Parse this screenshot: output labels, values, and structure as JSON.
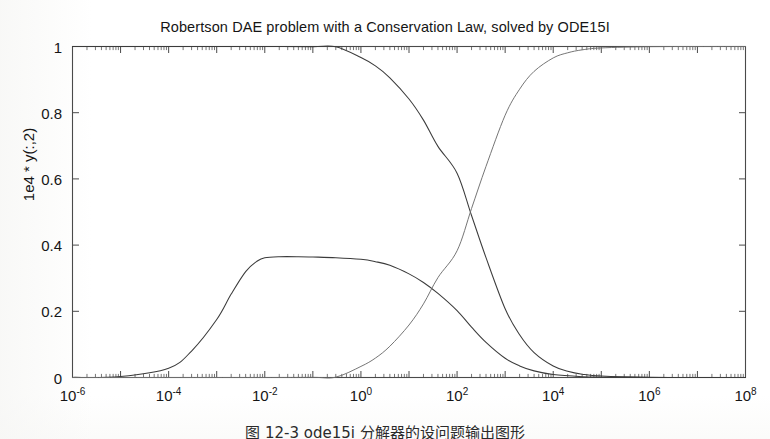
{
  "figure": {
    "title": "Robertson DAE problem with a Conservation Law, solved by ODE15I",
    "ylabel": "1e4 * y(:,2)",
    "caption": "图 12-3  ode15i 分解器的设问题输出图形"
  },
  "axes": {
    "x_tick_labels": [
      {
        "mantissa": "10",
        "exponent": "-6",
        "value": 1e-06
      },
      {
        "mantissa": "10",
        "exponent": "-4",
        "value": 0.0001
      },
      {
        "mantissa": "10",
        "exponent": "-2",
        "value": 0.01
      },
      {
        "mantissa": "10",
        "exponent": "0",
        "value": 1
      },
      {
        "mantissa": "10",
        "exponent": "2",
        "value": 100
      },
      {
        "mantissa": "10",
        "exponent": "4",
        "value": 10000
      },
      {
        "mantissa": "10",
        "exponent": "6",
        "value": 1000000
      },
      {
        "mantissa": "10",
        "exponent": "8",
        "value": 100000000
      }
    ],
    "y_tick_labels": [
      "0",
      "0.2",
      "0.4",
      "0.6",
      "0.8",
      "1"
    ]
  },
  "colors": {
    "curve": "#3b3b3b",
    "curve_light": "#6e6e6e",
    "axis": "#4a4a4a",
    "background": "#ffffff",
    "text": "#151515"
  },
  "chart_data": {
    "type": "line",
    "title": "Robertson DAE problem with a Conservation Law, solved by ODE15I",
    "xlabel": "",
    "ylabel": "1e4 * y(:,2)",
    "xscale": "log",
    "yscale": "linear",
    "xlim": [
      1e-06,
      100000000.0
    ],
    "ylim": [
      0,
      1
    ],
    "grid": false,
    "legend": "none",
    "minor_ticks": "log-decade, inward",
    "series": [
      {
        "name": "y(:,1)",
        "description": "species A, decays from 1 to 0",
        "points": [
          [
            1e-06,
            1.0
          ],
          [
            1e-05,
            1.0
          ],
          [
            0.0001,
            1.0
          ],
          [
            0.001,
            1.0
          ],
          [
            0.01,
            0.9999
          ],
          [
            0.1,
            0.9996
          ],
          [
            0.3,
            0.999
          ],
          [
            1.0,
            0.9665
          ],
          [
            2.0,
            0.9414
          ],
          [
            4.0,
            0.9055
          ],
          [
            10.0,
            0.8414
          ],
          [
            20.0,
            0.7776
          ],
          [
            40.0,
            0.6982
          ],
          [
            100.0,
            0.6172
          ],
          [
            200.0,
            0.4895
          ],
          [
            400.0,
            0.3621
          ],
          [
            1000.0,
            0.2076
          ],
          [
            2000.0,
            0.129
          ],
          [
            4000.0,
            0.0751
          ],
          [
            10000.0,
            0.0345
          ],
          [
            20000.0,
            0.019
          ],
          [
            40000.0,
            0.0101
          ],
          [
            100000.0,
            0.0043
          ],
          [
            1000000.0,
            0.00045
          ],
          [
            10000000.0,
            4.5e-05
          ],
          [
            100000000.0,
            4.5e-06
          ]
        ]
      },
      {
        "name": "1e4 * y(:,2)",
        "description": "species B scaled by 1e4, bump peaking near 0.365 plateau between 1e-2 and 1e0",
        "points": [
          [
            1e-06,
            0.0003
          ],
          [
            1e-05,
            0.003
          ],
          [
            0.0001,
            0.028
          ],
          [
            0.0003,
            0.08
          ],
          [
            0.001,
            0.175
          ],
          [
            0.002,
            0.252
          ],
          [
            0.004,
            0.32
          ],
          [
            0.007,
            0.352
          ],
          [
            0.01,
            0.362
          ],
          [
            0.02,
            0.365
          ],
          [
            0.05,
            0.365
          ],
          [
            0.1,
            0.364
          ],
          [
            0.3,
            0.362
          ],
          [
            1.0,
            0.357
          ],
          [
            2.0,
            0.35
          ],
          [
            4.0,
            0.339
          ],
          [
            10.0,
            0.313
          ],
          [
            20.0,
            0.287
          ],
          [
            40.0,
            0.254
          ],
          [
            100.0,
            0.202
          ],
          [
            200.0,
            0.152
          ],
          [
            400.0,
            0.106
          ],
          [
            1000.0,
            0.058
          ],
          [
            2000.0,
            0.035
          ],
          [
            4000.0,
            0.02
          ],
          [
            10000.0,
            0.009
          ],
          [
            40000.0,
            0.0025
          ],
          [
            100000.0,
            0.001
          ],
          [
            1000000.0,
            0.0001
          ],
          [
            10000000.0,
            1e-05
          ],
          [
            100000000.0,
            1e-06
          ]
        ]
      },
      {
        "name": "y(:,3)",
        "description": "species C, rises from 0 to 1",
        "points": [
          [
            1e-06,
            0.0
          ],
          [
            0.01,
            1e-05
          ],
          [
            0.1,
            0.0004
          ],
          [
            0.3,
            0.001
          ],
          [
            1.0,
            0.0335
          ],
          [
            2.0,
            0.0586
          ],
          [
            4.0,
            0.0945
          ],
          [
            10.0,
            0.1586
          ],
          [
            20.0,
            0.2224
          ],
          [
            40.0,
            0.3018
          ],
          [
            100.0,
            0.3828
          ],
          [
            200.0,
            0.5105
          ],
          [
            400.0,
            0.6379
          ],
          [
            1000.0,
            0.7924
          ],
          [
            2000.0,
            0.871
          ],
          [
            4000.0,
            0.9249
          ],
          [
            10000.0,
            0.9655
          ],
          [
            20000.0,
            0.981
          ],
          [
            40000.0,
            0.9899
          ],
          [
            100000.0,
            0.9957
          ],
          [
            1000000.0,
            0.99955
          ],
          [
            10000000.0,
            0.999955
          ],
          [
            100000000.0,
            0.9999955
          ]
        ]
      }
    ]
  }
}
